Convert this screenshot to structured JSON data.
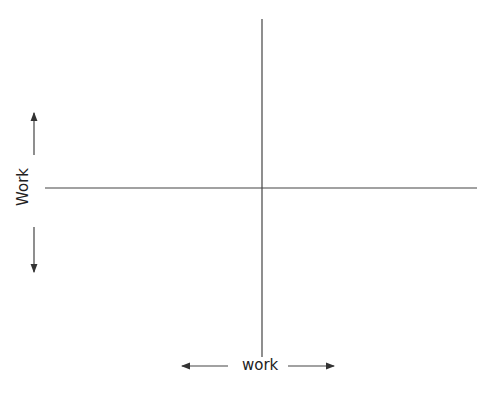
{
  "diagram": {
    "type": "quadrant",
    "x_axis_label": "work",
    "y_axis_label": "Work",
    "line_color": "#333333",
    "center": {
      "x": 262,
      "y": 188
    }
  }
}
